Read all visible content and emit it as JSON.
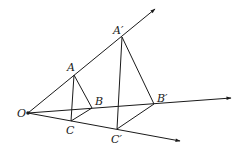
{
  "diagram": {
    "type": "homothety / similar triangles (dilation from center O)",
    "points": {
      "O": {
        "label": "O",
        "x": 28,
        "y": 113
      },
      "A": {
        "label": "A",
        "x": 74,
        "y": 75
      },
      "B": {
        "label": "B",
        "x": 92,
        "y": 108
      },
      "C": {
        "label": "C",
        "x": 71,
        "y": 121
      },
      "A2": {
        "label": "A′",
        "x": 122,
        "y": 37
      },
      "B2": {
        "label": "B′",
        "x": 154,
        "y": 104
      },
      "C2": {
        "label": "C′",
        "x": 117,
        "y": 129
      }
    },
    "rays": [
      {
        "name": "ray-OA",
        "from": "O",
        "through": "A′",
        "end": {
          "x": 155,
          "y": 9
        }
      },
      {
        "name": "ray-OB",
        "from": "O",
        "through": "B′",
        "end": {
          "x": 231,
          "y": 98
        }
      },
      {
        "name": "ray-OC",
        "from": "O",
        "through": "C′",
        "end": {
          "x": 180,
          "y": 141
        }
      }
    ],
    "triangles": [
      {
        "name": "ABC",
        "vertices": [
          "A",
          "B",
          "C"
        ]
      },
      {
        "name": "A′B′C′",
        "vertices": [
          "A′",
          "B′",
          "C′"
        ]
      }
    ]
  }
}
